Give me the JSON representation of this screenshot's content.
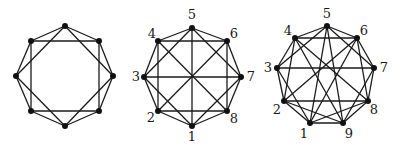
{
  "figure": {
    "graphs": [
      {
        "id": "graph-1",
        "labeled": false,
        "nodes": [
          {
            "id": "a",
            "label": "",
            "x": 65,
            "y": 26
          },
          {
            "id": "b",
            "label": "",
            "x": 99,
            "y": 41
          },
          {
            "id": "c",
            "label": "",
            "x": 113,
            "y": 76
          },
          {
            "id": "d",
            "label": "",
            "x": 99,
            "y": 111
          },
          {
            "id": "e",
            "label": "",
            "x": 65,
            "y": 126
          },
          {
            "id": "f",
            "label": "",
            "x": 31,
            "y": 111
          },
          {
            "id": "g",
            "label": "",
            "x": 16,
            "y": 76
          },
          {
            "id": "h",
            "label": "",
            "x": 31,
            "y": 41
          }
        ],
        "edges": [
          [
            "a",
            "b"
          ],
          [
            "b",
            "c"
          ],
          [
            "c",
            "d"
          ],
          [
            "d",
            "e"
          ],
          [
            "e",
            "f"
          ],
          [
            "f",
            "g"
          ],
          [
            "g",
            "h"
          ],
          [
            "h",
            "a"
          ],
          [
            "h",
            "b"
          ],
          [
            "b",
            "d"
          ],
          [
            "d",
            "f"
          ],
          [
            "f",
            "h"
          ],
          [
            "a",
            "c"
          ],
          [
            "c",
            "e"
          ],
          [
            "e",
            "g"
          ],
          [
            "g",
            "a"
          ]
        ]
      },
      {
        "id": "graph-2",
        "labeled": true,
        "nodes": [
          {
            "id": "1",
            "label": "1",
            "x": 192,
            "y": 126,
            "lx": 192,
            "ly": 137
          },
          {
            "id": "2",
            "label": "2",
            "x": 158,
            "y": 111,
            "lx": 151,
            "ly": 118
          },
          {
            "id": "3",
            "label": "3",
            "x": 144,
            "y": 77,
            "lx": 136,
            "ly": 77
          },
          {
            "id": "4",
            "label": "4",
            "x": 158,
            "y": 41,
            "lx": 152,
            "ly": 34
          },
          {
            "id": "5",
            "label": "5",
            "x": 192,
            "y": 28,
            "lx": 192,
            "ly": 15
          },
          {
            "id": "6",
            "label": "6",
            "x": 227,
            "y": 41,
            "lx": 234,
            "ly": 34
          },
          {
            "id": "7",
            "label": "7",
            "x": 241,
            "y": 77,
            "lx": 251,
            "ly": 77
          },
          {
            "id": "8",
            "label": "8",
            "x": 227,
            "y": 111,
            "lx": 234,
            "ly": 119
          }
        ],
        "edges": [
          [
            "1",
            "2"
          ],
          [
            "2",
            "3"
          ],
          [
            "3",
            "4"
          ],
          [
            "4",
            "5"
          ],
          [
            "5",
            "6"
          ],
          [
            "6",
            "7"
          ],
          [
            "7",
            "8"
          ],
          [
            "8",
            "1"
          ],
          [
            "2",
            "4"
          ],
          [
            "4",
            "6"
          ],
          [
            "6",
            "8"
          ],
          [
            "8",
            "2"
          ],
          [
            "1",
            "3"
          ],
          [
            "3",
            "5"
          ],
          [
            "5",
            "7"
          ],
          [
            "7",
            "1"
          ],
          [
            "1",
            "5"
          ],
          [
            "3",
            "7"
          ],
          [
            "4",
            "8"
          ],
          [
            "2",
            "6"
          ]
        ]
      },
      {
        "id": "graph-3",
        "labeled": true,
        "nodes": [
          {
            "id": "1",
            "label": "1",
            "x": 310,
            "y": 123,
            "lx": 304,
            "ly": 134
          },
          {
            "id": "2",
            "label": "2",
            "x": 284,
            "y": 101,
            "lx": 277,
            "ly": 110
          },
          {
            "id": "3",
            "label": "3",
            "x": 277,
            "y": 68,
            "lx": 268,
            "ly": 68
          },
          {
            "id": "4",
            "label": "4",
            "x": 295,
            "y": 38,
            "lx": 288,
            "ly": 31
          },
          {
            "id": "5",
            "label": "5",
            "x": 327,
            "y": 26,
            "lx": 327,
            "ly": 14
          },
          {
            "id": "6",
            "label": "6",
            "x": 357,
            "y": 38,
            "lx": 364,
            "ly": 31
          },
          {
            "id": "7",
            "label": "7",
            "x": 374,
            "y": 68,
            "lx": 384,
            "ly": 68
          },
          {
            "id": "8",
            "label": "8",
            "x": 368,
            "y": 101,
            "lx": 374,
            "ly": 110
          },
          {
            "id": "9",
            "label": "9",
            "x": 343,
            "y": 123,
            "lx": 349,
            "ly": 134
          }
        ],
        "edges": [
          [
            "1",
            "2"
          ],
          [
            "2",
            "3"
          ],
          [
            "3",
            "4"
          ],
          [
            "4",
            "5"
          ],
          [
            "5",
            "6"
          ],
          [
            "6",
            "7"
          ],
          [
            "7",
            "8"
          ],
          [
            "8",
            "9"
          ],
          [
            "9",
            "1"
          ],
          [
            "4",
            "6"
          ],
          [
            "3",
            "5"
          ],
          [
            "5",
            "7"
          ],
          [
            "6",
            "8"
          ],
          [
            "7",
            "9"
          ],
          [
            "2",
            "4"
          ],
          [
            "5",
            "1"
          ],
          [
            "5",
            "9"
          ],
          [
            "3",
            "7"
          ],
          [
            "4",
            "8"
          ],
          [
            "4",
            "9"
          ],
          [
            "6",
            "2"
          ],
          [
            "6",
            "1"
          ],
          [
            "3",
            "1"
          ],
          [
            "2",
            "9"
          ],
          [
            "2",
            "8"
          ],
          [
            "1",
            "8"
          ]
        ]
      }
    ]
  }
}
